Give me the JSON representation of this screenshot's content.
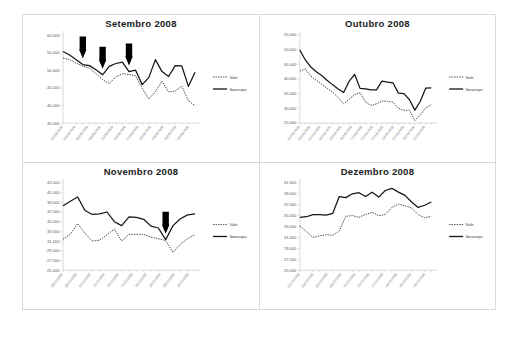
{
  "figure": {
    "name": "quarterly-stock-comparison-figure",
    "background_color": "#ffffff",
    "frame_color": "#d9d9d9"
  },
  "legend": {
    "series_dotted_label": "Vale",
    "series_solid_label": "Ibovespa",
    "position": "right"
  },
  "chart_data": [
    {
      "type": "line",
      "panel": "top-left",
      "title": "Setembro  2008",
      "xlabel": "",
      "ylabel": "",
      "ylim": [
        35000,
        60000
      ],
      "yticks": [
        35000,
        40000,
        45000,
        50000,
        55000,
        60000
      ],
      "ytick_labels": [
        "35.000",
        "40.000",
        "45.000",
        "50.000",
        "55.000",
        "60.000"
      ],
      "grid": false,
      "categories": [
        "01/09/2008",
        "03/09/2008",
        "05/09/2008",
        "09/09/2008",
        "11/09/2008",
        "15/09/2008",
        "17/09/2008",
        "19/09/2008",
        "23/09/2008",
        "25/09/2008",
        "29/09/2008"
      ],
      "x": [
        1,
        2,
        3,
        4,
        5,
        6,
        7,
        8,
        9,
        10,
        11,
        12,
        13,
        14,
        15,
        16,
        17,
        18,
        19,
        20,
        21
      ],
      "series": [
        {
          "name": "Ibovespa",
          "style": "solid",
          "values": [
            55300,
            54300,
            53000,
            51600,
            51300,
            50100,
            48700,
            51100,
            51900,
            52300,
            49600,
            50000,
            45900,
            47900,
            53000,
            49600,
            48200,
            51300,
            51200,
            45400,
            49400
          ]
        },
        {
          "name": "Vale",
          "style": "dotted",
          "values": [
            53500,
            53000,
            52000,
            51200,
            50600,
            49000,
            47300,
            46200,
            48100,
            49000,
            48800,
            48400,
            44900,
            41800,
            43900,
            46900,
            43800,
            44100,
            45500,
            41300,
            39900
          ]
        }
      ],
      "annotations": [
        {
          "type": "down-arrow",
          "x_index": 3,
          "label": "arrow-marker-1"
        },
        {
          "type": "down-arrow",
          "x_index": 6,
          "label": "arrow-marker-2"
        },
        {
          "type": "down-arrow",
          "x_index": 10,
          "label": "arrow-marker-3"
        }
      ]
    },
    {
      "type": "line",
      "panel": "top-right",
      "title": "Outubro  2008",
      "xlabel": "",
      "ylabel": "",
      "ylim": [
        25000,
        55000
      ],
      "yticks": [
        25000,
        30000,
        35000,
        40000,
        45000,
        50000,
        55000
      ],
      "ytick_labels": [
        "25.000",
        "30.000",
        "35.000",
        "40.000",
        "45.000",
        "50.000",
        "55.000"
      ],
      "grid": false,
      "categories": [
        "01/10/2008",
        "03/10/2008",
        "07/10/2008",
        "09/10/2008",
        "13/10/2008",
        "15/10/2008",
        "17/10/2008",
        "21/10/2008",
        "22/10/2008",
        "23/10/2008",
        "27/10/2008",
        "29/10/2008",
        "31/10/2008"
      ],
      "x": [
        1,
        2,
        3,
        4,
        5,
        6,
        7,
        8,
        9,
        10,
        11,
        12,
        13,
        14,
        15,
        16,
        17,
        18,
        19,
        20,
        21,
        22,
        23
      ],
      "series": [
        {
          "name": "Ibovespa",
          "style": "solid",
          "values": [
            49900,
            46500,
            44100,
            42500,
            41200,
            39500,
            38000,
            36600,
            35400,
            39200,
            41600,
            36800,
            36600,
            36300,
            36300,
            39300,
            38900,
            38700,
            35200,
            35000,
            33000,
            29400,
            32400,
            36900,
            37000
          ]
        },
        {
          "name": "Vale",
          "style": "dotted",
          "values": [
            42700,
            43400,
            41000,
            39600,
            38200,
            36800,
            35500,
            33700,
            31500,
            33100,
            34700,
            35300,
            32100,
            31000,
            31500,
            32500,
            32400,
            32100,
            30000,
            29300,
            29400,
            25800,
            27800,
            30200,
            31200
          ]
        }
      ],
      "annotations": []
    },
    {
      "type": "line",
      "panel": "bottom-left",
      "title": "Novembro  2008",
      "xlabel": "",
      "ylabel": "",
      "ylim": [
        25000,
        43000
      ],
      "yticks": [
        25000,
        27000,
        29000,
        31000,
        33000,
        35000,
        37000,
        39000,
        41000,
        43000
      ],
      "ytick_labels": [
        "25.000",
        "27.000",
        "29.000",
        "31.000",
        "33.000",
        "35.000",
        "37.000",
        "39.000",
        "41.000",
        "43.000"
      ],
      "grid": false,
      "categories": [
        "03/11/2008",
        "05/11/2008",
        "07/11/2008",
        "11/11/2008",
        "13/11/2008",
        "17/11/2008",
        "19/11/2008",
        "24/11/2008",
        "26/11/2008",
        "28/11/2008"
      ],
      "x": [
        1,
        2,
        3,
        4,
        5,
        6,
        7,
        8,
        9,
        10,
        11,
        12,
        13,
        14,
        15,
        16,
        17,
        18,
        19
      ],
      "series": [
        {
          "name": "Ibovespa",
          "style": "solid",
          "values": [
            38300,
            39200,
            40100,
            37300,
            36500,
            36600,
            37000,
            35000,
            34200,
            36000,
            35900,
            35500,
            34100,
            33700,
            31300,
            34200,
            35600,
            36400,
            36600
          ]
        },
        {
          "name": "Vale",
          "style": "dotted",
          "values": [
            31400,
            32400,
            34600,
            32600,
            31000,
            31200,
            32300,
            33500,
            31000,
            32400,
            32400,
            32400,
            31800,
            31500,
            31100,
            28700,
            30400,
            31500,
            32400
          ]
        }
      ],
      "annotations": [
        {
          "type": "down-arrow",
          "x_index": 14,
          "label": "arrow-marker-1"
        }
      ]
    },
    {
      "type": "line",
      "panel": "bottom-right",
      "title": "Dezembro  2008",
      "xlabel": "",
      "ylabel": "",
      "ylim": [
        25000,
        41000
      ],
      "yticks": [
        25000,
        27000,
        29000,
        31000,
        33000,
        35000,
        37000,
        39000,
        41000
      ],
      "ytick_labels": [
        "25.000",
        "27.000",
        "29.000",
        "31.000",
        "33.000",
        "35.000",
        "37.000",
        "39.000",
        "41.000"
      ],
      "grid": false,
      "categories": [
        "01/12/2008",
        "03/12/2008",
        "05/12/2008",
        "09/12/2008",
        "11/12/2008",
        "15/12/2008",
        "17/12/2008",
        "19/12/2008",
        "23/12/2008",
        "29/12/2008"
      ],
      "x": [
        1,
        2,
        3,
        4,
        5,
        6,
        7,
        8,
        9,
        10,
        11,
        12,
        13,
        14,
        15,
        16,
        17,
        18,
        19,
        20,
        21
      ],
      "series": [
        {
          "name": "Ibovespa",
          "style": "solid",
          "values": [
            34700,
            34800,
            35200,
            35200,
            35100,
            35400,
            38500,
            38300,
            39000,
            39200,
            38500,
            39300,
            38400,
            39600,
            40000,
            39300,
            38700,
            37500,
            36500,
            36900,
            37500
          ]
        },
        {
          "name": "Vale",
          "style": "dotted",
          "values": [
            33100,
            32100,
            31000,
            31300,
            31500,
            31400,
            32200,
            34900,
            35000,
            34700,
            35200,
            35600,
            35000,
            35200,
            36500,
            37100,
            36800,
            36400,
            35200,
            34600,
            34900
          ]
        }
      ],
      "annotations": []
    }
  ]
}
